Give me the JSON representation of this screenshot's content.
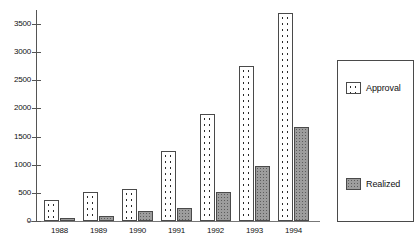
{
  "chart_data": {
    "type": "bar",
    "title": "",
    "xlabel": "",
    "ylabel": "",
    "ylim": [
      0,
      3750
    ],
    "grid": false,
    "legend_position": "right",
    "categories": [
      "1988",
      "1989",
      "1990",
      "1991",
      "1992",
      "1993",
      "1994"
    ],
    "ytick_labels": [
      "3500",
      "3000",
      "2500",
      "2000",
      "1500",
      "1000",
      "500",
      "0"
    ],
    "ytick_values": [
      3500,
      3000,
      2500,
      2000,
      1500,
      1000,
      500,
      0
    ],
    "series": [
      {
        "name": "Approval",
        "values": [
          375,
          520,
          570,
          1250,
          1900,
          2750,
          3700
        ]
      },
      {
        "name": "Realized",
        "values": [
          60,
          90,
          175,
          240,
          510,
          980,
          1670
        ]
      }
    ]
  },
  "legend": {
    "items": [
      {
        "label": "Approval",
        "pattern": "dotted-white"
      },
      {
        "label": "Realized",
        "pattern": "solid-gray"
      }
    ]
  },
  "colors": {
    "approval_fill": "#ffffff",
    "approval_dot": "#2a2a2a",
    "realized_fill": "#9d9d9d",
    "realized_dot": "#5d5d5d",
    "bar_border": "#4a4a4a",
    "axis": "#555555",
    "text": "#111111",
    "background": "#ffffff"
  }
}
